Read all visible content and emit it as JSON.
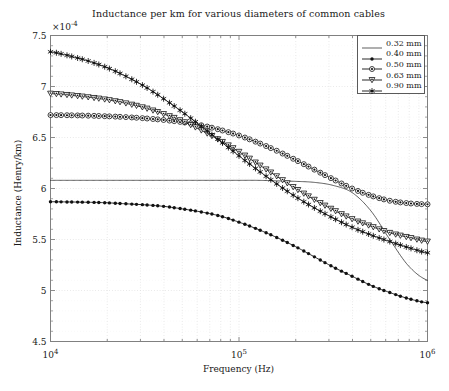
{
  "chart_data": {
    "type": "line",
    "title": "Inductance per km for various diameters of common cables",
    "xlabel": "Frequency (Hz)",
    "ylabel": "Inductance (Henry/km)",
    "xscale": "log",
    "yscale": "linear",
    "xlim": [
      10000,
      1000000
    ],
    "ylim": [
      4.5,
      7.5
    ],
    "y_multiplier": "×10",
    "y_multiplier_exponent": "-4",
    "y_multiplier_label": "×10⁻⁴",
    "yticks": [
      4.5,
      5,
      5.5,
      6,
      6.5,
      7,
      7.5
    ],
    "ytick_labels": [
      "4.5",
      "5",
      "5.5",
      "6",
      "6.5",
      "7",
      "7.5"
    ],
    "xticks": [
      10000,
      100000,
      1000000
    ],
    "xtick_labels": [
      "10⁴",
      "10⁵",
      "10⁶"
    ],
    "xtick_bases": [
      "10",
      "10",
      "10"
    ],
    "xtick_exponents": [
      "4",
      "5",
      "6"
    ],
    "grid": true,
    "grid_style": "dotted",
    "grid_minor": true,
    "legend_position": "upper right",
    "series": [
      {
        "name": "0.32 mm",
        "label": "0.32 mm",
        "marker": "none",
        "linewidth": 0.7,
        "color": "#1a1a1a",
        "x": [
          10000,
          12589,
          15849,
          19953,
          25119,
          31623,
          39811,
          50119,
          63096,
          79433,
          100000,
          125893,
          158489,
          199526,
          251189,
          316228,
          398107,
          501187,
          630957,
          794328,
          1000000
        ],
        "y": [
          6.08,
          6.08,
          6.08,
          6.08,
          6.08,
          6.08,
          6.08,
          6.08,
          6.08,
          6.08,
          6.08,
          6.08,
          6.075,
          6.07,
          6.06,
          6.03,
          5.96,
          5.78,
          5.5,
          5.24,
          5.1
        ]
      },
      {
        "name": "0.40 mm",
        "label": "0.40 mm",
        "marker": "dot",
        "linewidth": 0.9,
        "color": "#111111",
        "x": [
          10000,
          12589,
          15849,
          19953,
          25119,
          31623,
          39811,
          50119,
          63096,
          79433,
          100000,
          125893,
          158489,
          199526,
          251189,
          316228,
          398107,
          501187,
          630957,
          794328,
          1000000
        ],
        "y": [
          5.87,
          5.868,
          5.865,
          5.86,
          5.85,
          5.84,
          5.825,
          5.8,
          5.77,
          5.73,
          5.67,
          5.6,
          5.52,
          5.43,
          5.33,
          5.23,
          5.14,
          5.05,
          4.98,
          4.92,
          4.88
        ]
      },
      {
        "name": "0.50 mm",
        "label": "0.50 mm",
        "marker": "circle-dot",
        "linewidth": 0.9,
        "color": "#111111",
        "x": [
          10000,
          12589,
          15849,
          19953,
          25119,
          31623,
          39811,
          50119,
          63096,
          79433,
          100000,
          125893,
          158489,
          199526,
          251189,
          316228,
          398107,
          501187,
          630957,
          794328,
          1000000
        ],
        "y": [
          6.72,
          6.718,
          6.714,
          6.708,
          6.7,
          6.688,
          6.672,
          6.65,
          6.62,
          6.575,
          6.52,
          6.45,
          6.37,
          6.28,
          6.185,
          6.09,
          6.0,
          5.93,
          5.88,
          5.855,
          5.845
        ]
      },
      {
        "name": "0.63 mm",
        "label": "0.63 mm",
        "marker": "triangle-down",
        "linewidth": 0.9,
        "color": "#111111",
        "x": [
          10000,
          12589,
          15849,
          19953,
          25119,
          31623,
          39811,
          50119,
          63096,
          79433,
          100000,
          125893,
          158489,
          199526,
          251189,
          316228,
          398107,
          501187,
          630957,
          794328,
          1000000
        ],
        "y": [
          6.93,
          6.915,
          6.895,
          6.87,
          6.835,
          6.79,
          6.73,
          6.66,
          6.57,
          6.47,
          6.36,
          6.24,
          6.12,
          6.0,
          5.89,
          5.79,
          5.7,
          5.63,
          5.565,
          5.52,
          5.48
        ]
      },
      {
        "name": "0.90 mm",
        "label": "0.90 mm",
        "marker": "star",
        "linewidth": 0.9,
        "color": "#111111",
        "x": [
          10000,
          12589,
          15849,
          19953,
          25119,
          31623,
          39811,
          50119,
          63096,
          79433,
          100000,
          125893,
          158489,
          199526,
          251189,
          316228,
          398107,
          501187,
          630957,
          794328,
          1000000
        ],
        "y": [
          7.34,
          7.3,
          7.25,
          7.185,
          7.1,
          7.0,
          6.88,
          6.75,
          6.61,
          6.465,
          6.32,
          6.18,
          6.045,
          5.92,
          5.81,
          5.71,
          5.62,
          5.545,
          5.48,
          5.42,
          5.37
        ]
      }
    ]
  },
  "figure": {
    "background_color": "#ffffff",
    "axis_color": "#808080",
    "grid_color": "#d9d9d9",
    "text_color": "#1a1a1a"
  }
}
